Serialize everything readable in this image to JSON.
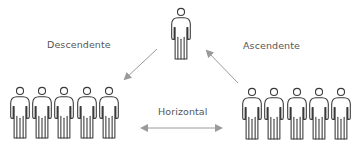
{
  "diagram": {
    "type": "communication-flow",
    "colors": {
      "figure_stroke": "#3a3a3a",
      "arrow": "#9a9a9a",
      "text": "#555555",
      "background": "#ffffff"
    },
    "labels": {
      "descending": "Descendente",
      "ascending": "Ascendente",
      "horizontal": "Horizontal"
    },
    "nodes": {
      "top": {
        "people_count": 1
      },
      "bottom_left": {
        "people_count": 5
      },
      "bottom_right": {
        "people_count": 5
      }
    },
    "edges": [
      {
        "from": "top",
        "to": "bottom_left",
        "label": "Descendente",
        "direction": "one-way"
      },
      {
        "from": "bottom_right",
        "to": "top",
        "label": "Ascendente",
        "direction": "one-way"
      },
      {
        "from": "bottom_left",
        "to": "bottom_right",
        "label": "Horizontal",
        "direction": "two-way"
      }
    ]
  }
}
